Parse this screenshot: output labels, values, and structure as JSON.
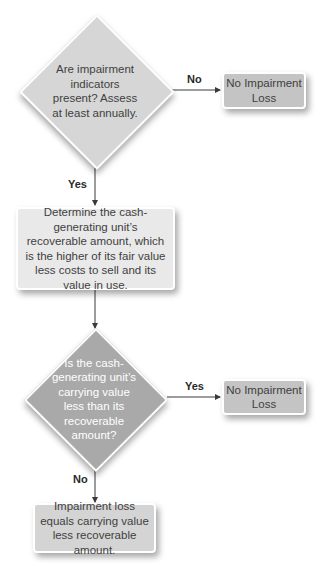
{
  "flowchart": {
    "decision1": {
      "text": "Are impairment indicators present? Assess at least annually."
    },
    "decision1_no_label": "No",
    "decision1_yes_label": "Yes",
    "outcome1": {
      "text": "No Impairment Loss"
    },
    "process1": {
      "text": "Determine the cash-generating unit’s recoverable amount, which is the higher of its fair value less costs to sell and its value in use."
    },
    "decision2": {
      "text": "Is the cash-generating unit’s carrying value less than its recoverable amount?"
    },
    "decision2_yes_label": "Yes",
    "decision2_no_label": "No",
    "outcome2": {
      "text": "No Impairment Loss"
    },
    "outcome3": {
      "text": "Impairment loss equals carrying value less recoverable amount."
    }
  },
  "colors": {
    "decision1_fill": "#d6d6d6",
    "decision2_fill": "#a9a9a9",
    "outcome_fill": "#c4c4c4",
    "process_fill": "#e9e9e9",
    "final_fill": "#d4d4d4",
    "line": "#3a3a3a"
  }
}
